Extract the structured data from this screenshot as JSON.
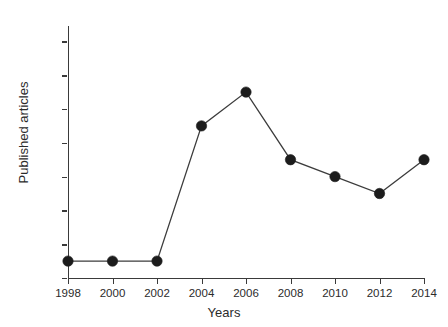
{
  "chart_data": {
    "type": "line",
    "title": "",
    "xlabel": "Years",
    "ylabel": "Published articles",
    "x": [
      1998,
      2000,
      2002,
      2004,
      2006,
      2008,
      2010,
      2012,
      2014
    ],
    "categories": [
      "1998",
      "2000",
      "2002",
      "2004",
      "2006",
      "2008",
      "2010",
      "2012",
      "2014"
    ],
    "values": [
      1,
      1,
      1,
      9,
      11,
      7,
      6,
      5,
      7
    ],
    "series": [
      {
        "name": "Published articles",
        "values": [
          1,
          1,
          1,
          9,
          11,
          7,
          6,
          5,
          7
        ]
      }
    ],
    "xlim": [
      1998,
      2014
    ],
    "ylim": [
      0,
      15
    ],
    "yticks": [
      0,
      2,
      4,
      6,
      8,
      10,
      12,
      14
    ],
    "ytick_labels": [
      "0",
      "2",
      "4",
      "6",
      "8",
      "10",
      "12",
      "14"
    ],
    "xticks": [
      1998,
      2000,
      2002,
      2004,
      2006,
      2008,
      2010,
      2012,
      2014
    ],
    "xtick_labels": [
      "1998",
      "2000",
      "2002",
      "2004",
      "2006",
      "2008",
      "2010",
      "2012",
      "2014"
    ],
    "grid": false,
    "legend": false,
    "legend_position": "none",
    "marker": "filled-circle",
    "line_color": "#3c3c3c",
    "marker_color": "#1c1c1c",
    "background_color": "#ffffff",
    "annotations": []
  }
}
